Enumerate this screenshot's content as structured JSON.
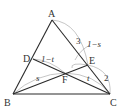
{
  "diagram": {
    "type": "triangle-cevians",
    "points": {
      "A": {
        "label": "A",
        "x": 52,
        "y": 20
      },
      "B": {
        "label": "B",
        "x": 13,
        "y": 94
      },
      "C": {
        "label": "C",
        "x": 110,
        "y": 94
      },
      "D": {
        "label": "D",
        "x": 33,
        "y": 59
      },
      "E": {
        "label": "E",
        "x": 88,
        "y": 65
      },
      "F": {
        "label": "F",
        "x": 65,
        "y": 73
      }
    },
    "segment_labels": {
      "AE": "3",
      "EC": "2",
      "AE_frac": "1−s",
      "DF": "1−t",
      "BF": "s",
      "FC": "t"
    },
    "colors": {
      "line": "#2a2a2a",
      "arc": "#9a9a9a",
      "text": "#333333"
    }
  }
}
